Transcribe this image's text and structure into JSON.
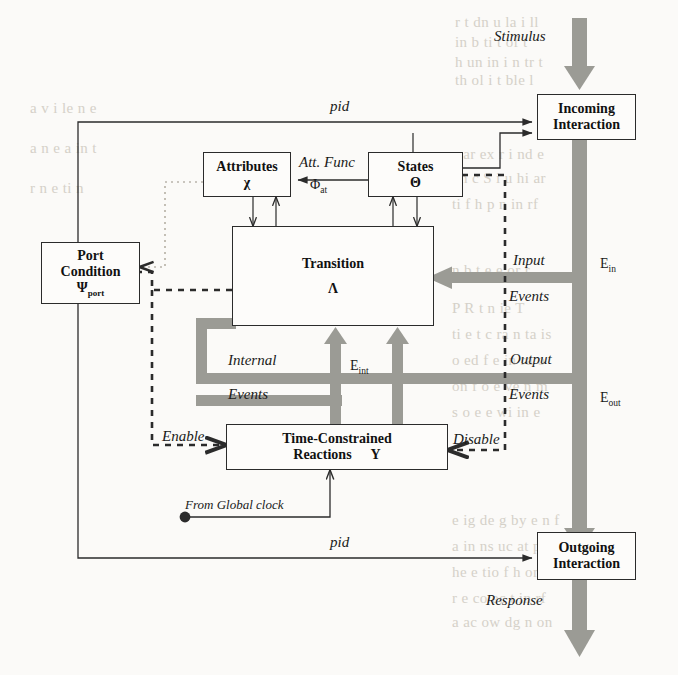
{
  "diagram": {
    "colors": {
      "ink": "#2b2b2b",
      "paper": "#fbfaf8",
      "thick_arrow_fill": "#9a9a94",
      "bleed_text": "#cfcac1"
    },
    "boxes": [
      {
        "id": "incoming",
        "line1": "Incoming",
        "line2": "Interaction",
        "symbol": ""
      },
      {
        "id": "attributes",
        "line1": "Attributes",
        "line2": "",
        "symbol": "χ"
      },
      {
        "id": "states",
        "line1": "States",
        "line2": "",
        "symbol": "Θ"
      },
      {
        "id": "transition",
        "line1": "Transition",
        "line2": "",
        "symbol": "Λ"
      },
      {
        "id": "portcond",
        "line1": "Port",
        "line2": "Condition",
        "symbol": "Ψ",
        "symbol_sub": "port"
      },
      {
        "id": "reactions",
        "line1": "Time-Constrained",
        "line2": "Reactions",
        "symbol": "Y"
      },
      {
        "id": "outgoing",
        "line1": "Outgoing",
        "line2": "Interaction",
        "symbol": ""
      }
    ],
    "labels": {
      "stimulus": "Stimulus",
      "response": "Response",
      "pid_top": "pid",
      "pid_bottom": "pid",
      "att_func": "Att. Func",
      "att_func_symbol": "Φ",
      "att_func_sub": "at",
      "input": "Input",
      "input_events": "Events",
      "e_in": "E",
      "e_in_sub": "in",
      "output": "Output",
      "output_events": "Events",
      "e_out": "E",
      "e_out_sub": "out",
      "internal": "Internal",
      "internal_events": "Events",
      "e_int": "E",
      "e_int_sub": "int",
      "enable": "Enable",
      "disable": "Disable",
      "global_clock": "From Global  clock"
    },
    "bleed_text": [
      {
        "t": "r  t dn   u   la  i  ll",
        "x": 455,
        "y": 14
      },
      {
        "t": "in   b  ti   t  of    t",
        "x": 455,
        "y": 34
      },
      {
        "t": "h  un  in  i   n tr  t",
        "x": 455,
        "y": 54
      },
      {
        "t": "th   ol   i    t  ble    l",
        "x": 455,
        "y": 72
      },
      {
        "t": "e   ar   ex  r  i   nd   e",
        "x": 452,
        "y": 146
      },
      {
        "t": "on  c   S  i   u   hi  ar",
        "x": 452,
        "y": 170
      },
      {
        "t": "ti   f  h    p  n  in  rf",
        "x": 452,
        "y": 196
      },
      {
        "t": "n   b  t  e   e  or    r",
        "x": 452,
        "y": 262
      },
      {
        "t": "P  R   t  n    ie    T   ",
        "x": 452,
        "y": 300
      },
      {
        "t": "ti  e  t  c   ra  n   ta   is",
        "x": 452,
        "y": 326
      },
      {
        "t": "o   ed   f  e  in   ra   o",
        "x": 452,
        "y": 352
      },
      {
        "t": "on   f   o   e  ve  n   m",
        "x": 452,
        "y": 378
      },
      {
        "t": "s  o  e    e   wi   in   e",
        "x": 452,
        "y": 404
      },
      {
        "t": "e   ig   de  g   by   e  n    f",
        "x": 452,
        "y": 512
      },
      {
        "t": "a   in   ns  uc    at     p   s",
        "x": 452,
        "y": 538
      },
      {
        "t": "he   e    tio    f  h   or    n",
        "x": 452,
        "y": 564
      },
      {
        "t": "r  e   co   ec   t   in   rf",
        "x": 452,
        "y": 590
      },
      {
        "t": "a   ac  ow   dg    n     on",
        "x": 452,
        "y": 614
      },
      {
        "t": "a  v   i   le   n   e",
        "x": 30,
        "y": 100
      },
      {
        "t": "a   n   e   a    in  t",
        "x": 30,
        "y": 140
      },
      {
        "t": "r  n  e   ti   n",
        "x": 30,
        "y": 180
      }
    ]
  }
}
